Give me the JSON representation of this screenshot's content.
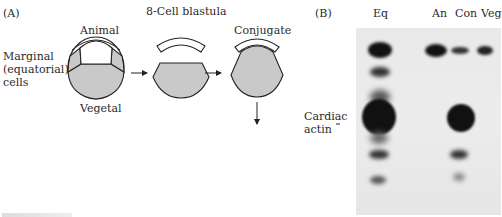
{
  "panel_a": {
    "letter": "(A)",
    "title": "8-Cell blastula",
    "labels": {
      "animal": "Animal",
      "vegetal": "Vegetal",
      "marginal_line1": "Marginal",
      "marginal_line2": "(equatorial)",
      "marginal_line3": "cells",
      "conjugate": "Conjugate"
    },
    "colors": {
      "vegetal_fill": "#c9c9c9",
      "outline": "#222222"
    }
  },
  "panel_b": {
    "letter": "(B)",
    "lanes": [
      "Eq",
      "An",
      "Con",
      "Veg"
    ],
    "marker_label_line1": "Cardiac",
    "marker_label_line2": "actin"
  },
  "caption_partial": ""
}
